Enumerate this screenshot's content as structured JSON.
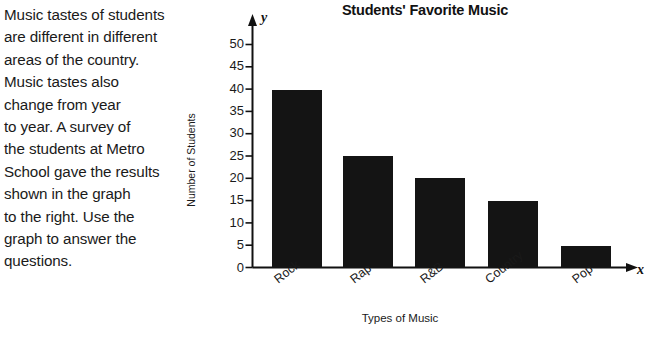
{
  "passage": {
    "lines": [
      "Music tastes of students",
      "are different in different",
      "areas of the country.",
      "Music tastes also",
      "change from year",
      "to year. A survey of",
      "the students at Metro",
      "School gave the results",
      "shown in the graph",
      "to the right. Use the",
      "graph to answer the",
      "questions."
    ]
  },
  "chart_data": {
    "type": "bar",
    "title": "Students' Favorite Music",
    "xlabel": "Types of Music",
    "ylabel": "Number of Students",
    "categories": [
      "Rock",
      "Rap",
      "R&B",
      "Country",
      "Pop"
    ],
    "values": [
      40,
      25,
      20,
      15,
      5
    ],
    "ylim": [
      0,
      50
    ],
    "ytick_labels": [
      "0",
      "5",
      "10",
      "15",
      "20",
      "25",
      "30",
      "35",
      "40",
      "45",
      "50"
    ],
    "ytick_values": [
      0,
      5,
      10,
      15,
      20,
      25,
      30,
      35,
      40,
      45,
      50
    ],
    "grid": false,
    "legend": null,
    "bar_color": "#141414",
    "axis_color": "#111111",
    "x_axis_letter": "x",
    "y_axis_letter": "y"
  }
}
